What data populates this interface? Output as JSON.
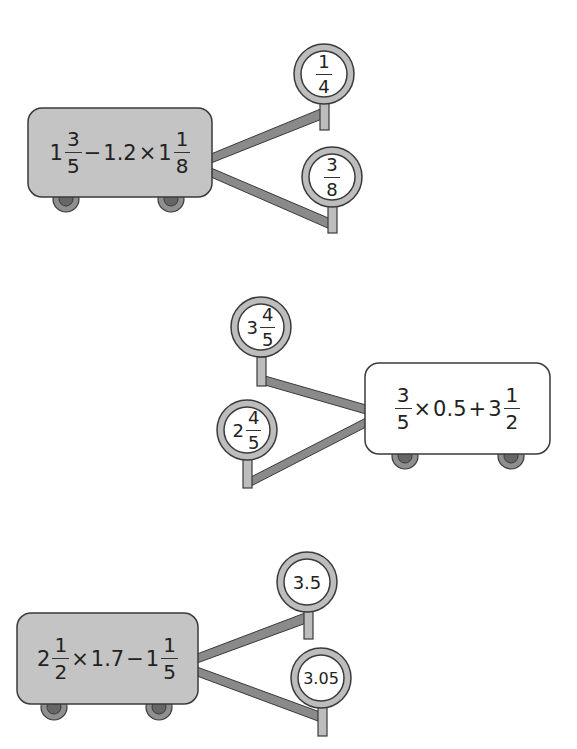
{
  "colors": {
    "cart_gray": "#c4c4c4",
    "cart_white": "#ffffff",
    "outline": "#3a3a3a",
    "link": "#8a8a8a",
    "ring": "#bdbdbd",
    "wheel_outer": "#8f8f8f",
    "wheel_inner": "#666666"
  },
  "carts": [
    {
      "fill": "gray",
      "expression_text": "1 3/5 − 1.2 × 1 1/8",
      "expr": {
        "whole1": "1",
        "num1": "3",
        "den1": "5",
        "op1": "−",
        "dec": "1.2",
        "op2": "×",
        "whole2": "1",
        "num2": "1",
        "den2": "8"
      },
      "answers": [
        {
          "text": "1/4",
          "num": "1",
          "den": "4"
        },
        {
          "text": "3/8",
          "num": "3",
          "den": "8"
        }
      ]
    },
    {
      "fill": "white",
      "expression_text": "3/5 × 0.5 + 3 1/2",
      "expr": {
        "num1": "3",
        "den1": "5",
        "op1": "×",
        "dec": "0.5",
        "op2": "+",
        "whole2": "3",
        "num2": "1",
        "den2": "2"
      },
      "answers": [
        {
          "text": "3 4/5",
          "whole": "3",
          "num": "4",
          "den": "5"
        },
        {
          "text": "2 4/5",
          "whole": "2",
          "num": "4",
          "den": "5"
        }
      ]
    },
    {
      "fill": "gray",
      "expression_text": "2 1/2 × 1.7 − 1 1/5",
      "expr": {
        "whole1": "2",
        "num1": "1",
        "den1": "2",
        "op1": "×",
        "dec": "1.7",
        "op2": "−",
        "whole2": "1",
        "num2": "1",
        "den2": "5"
      },
      "answers": [
        {
          "text": "3.5"
        },
        {
          "text": "3.05"
        }
      ]
    }
  ]
}
